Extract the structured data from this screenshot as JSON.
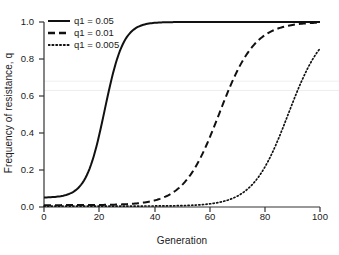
{
  "chart_data": {
    "type": "line",
    "title": "",
    "xlabel": "Generation",
    "ylabel": "Frequency of resistance, q",
    "xlim": [
      0,
      100
    ],
    "ylim": [
      0,
      1.0
    ],
    "xticks": [
      0,
      20,
      40,
      60,
      80,
      100
    ],
    "yticks": [
      "0.0",
      "0.2",
      "0.4",
      "0.6",
      "0.8",
      "1.0"
    ],
    "ytick_values": [
      0.0,
      0.2,
      0.4,
      0.6,
      0.8,
      1.0
    ],
    "grid": false,
    "legend_position": "top-left",
    "reference_lines": [
      0.68,
      0.63
    ],
    "series": [
      {
        "name": "q1 = 0.05",
        "style": "solid",
        "q0": 0.05,
        "midpoint": 22,
        "rate": 0.295,
        "x": [
          0,
          5,
          10,
          15,
          20,
          22,
          24,
          26,
          28,
          30,
          35,
          40,
          50,
          60,
          70,
          80,
          90,
          100
        ],
        "values": [
          0.05,
          0.1,
          0.2,
          0.36,
          0.58,
          0.68,
          0.78,
          0.86,
          0.92,
          0.95,
          0.99,
          0.997,
          1.0,
          1.0,
          1.0,
          1.0,
          1.0,
          1.0
        ]
      },
      {
        "name": "q1 = 0.01",
        "style": "dashed",
        "q0": 0.01,
        "midpoint": 63.5,
        "rate": 0.155,
        "x": [
          0,
          10,
          20,
          30,
          40,
          50,
          55,
          60,
          63,
          65,
          67,
          70,
          75,
          80,
          90,
          100
        ],
        "values": [
          0.01,
          0.013,
          0.018,
          0.025,
          0.04,
          0.1,
          0.18,
          0.36,
          0.5,
          0.62,
          0.74,
          0.88,
          0.97,
          0.99,
          1.0,
          1.0
        ]
      },
      {
        "name": "q1 = 0.005",
        "style": "dotted",
        "q0": 0.005,
        "midpoint": 88.5,
        "rate": 0.155,
        "x": [
          0,
          10,
          20,
          30,
          40,
          50,
          60,
          70,
          78,
          84,
          88,
          91,
          93,
          95,
          97,
          100
        ],
        "values": [
          0.005,
          0.006,
          0.008,
          0.011,
          0.016,
          0.025,
          0.04,
          0.09,
          0.2,
          0.38,
          0.5,
          0.7,
          0.82,
          0.92,
          0.97,
          1.0
        ]
      }
    ]
  },
  "legend": {
    "items": [
      {
        "label": "q1 = 0.05",
        "style": "solid"
      },
      {
        "label": "q1 = 0.01",
        "style": "dashed"
      },
      {
        "label": "q1 = 0.005",
        "style": "dotted"
      }
    ]
  },
  "colors": {
    "line": "#111111",
    "axis": "#333333",
    "reference_line": "#ededed",
    "background": "#ffffff"
  }
}
